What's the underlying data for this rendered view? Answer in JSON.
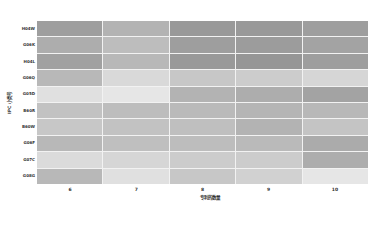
{
  "chart_data": {
    "type": "heatmap",
    "title": "",
    "xlabel": "专利的数量",
    "ylabel": "IPC 小类号",
    "x_categories": [
      "6",
      "7",
      "8",
      "9",
      "10"
    ],
    "y_categories": [
      "H04W",
      "G06K",
      "H04L",
      "G06Q",
      "G05D",
      "B60R",
      "B60W",
      "G06F",
      "G07C",
      "G08G"
    ],
    "values": [
      [
        0.62,
        0.7,
        0.6,
        0.6,
        0.62
      ],
      [
        0.68,
        0.74,
        0.62,
        0.61,
        0.64
      ],
      [
        0.63,
        0.72,
        0.6,
        0.59,
        0.62
      ],
      [
        0.72,
        0.85,
        0.78,
        0.8,
        0.84
      ],
      [
        0.88,
        0.9,
        0.7,
        0.68,
        0.64
      ],
      [
        0.76,
        0.74,
        0.73,
        0.71,
        0.72
      ],
      [
        0.78,
        0.76,
        0.75,
        0.7,
        0.77
      ],
      [
        0.72,
        0.75,
        0.74,
        0.73,
        0.67
      ],
      [
        0.86,
        0.84,
        0.8,
        0.8,
        0.68
      ],
      [
        0.72,
        0.88,
        0.78,
        0.82,
        0.9
      ]
    ],
    "colormap": "grayscale (darker = higher)",
    "legend": "none",
    "grid": true
  }
}
